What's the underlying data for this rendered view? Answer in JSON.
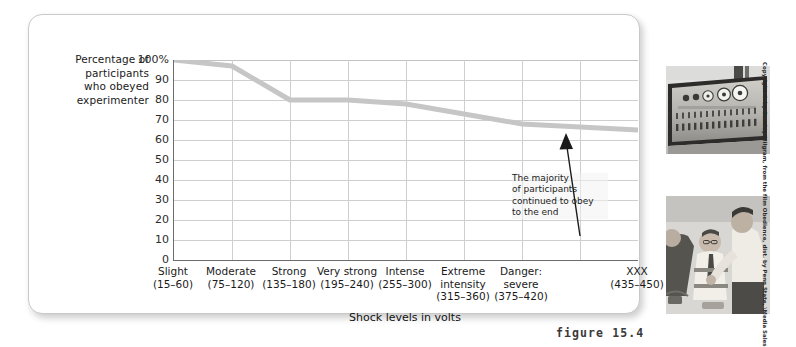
{
  "figure": {
    "number_label": "figure 15.4",
    "card_background": "#ffffff",
    "line_color": "#c6c6c6"
  },
  "chart_data": {
    "type": "line",
    "title": "",
    "ylabel": "Percentage of participants who obeyed experimenter",
    "xlabel": "Shock levels in volts",
    "ylim": [
      0,
      100
    ],
    "yticks": [
      "0",
      "10",
      "20",
      "30",
      "40",
      "50",
      "60",
      "70",
      "80",
      "90",
      "100%"
    ],
    "ytick_values": [
      0,
      10,
      20,
      30,
      40,
      50,
      60,
      70,
      80,
      90,
      100
    ],
    "grid": true,
    "legend": "none",
    "categories": [
      "Slight",
      "Moderate",
      "Strong",
      "Very strong",
      "Intense",
      "Extreme intensity",
      "Danger: severe",
      "XXX"
    ],
    "category_ranges": [
      "(15–60)",
      "(75–120)",
      "(135–180)",
      "(195–240)",
      "(255–300)",
      "(315–360)",
      "(375–420)",
      "(435–450)"
    ],
    "values": [
      100,
      97,
      80,
      80,
      78,
      73,
      68,
      65
    ],
    "annotations": [
      {
        "text": "The majority of participants continued to obey to the end",
        "lines": [
          "The majority",
          "of participants",
          "continued to obey",
          "to the end"
        ],
        "arrow": "up"
      }
    ]
  },
  "x_axis": {
    "title": "Shock levels in volts",
    "labels": [
      {
        "name": "Slight",
        "range": "(15–60)"
      },
      {
        "name": "Moderate",
        "range": "(75–120)"
      },
      {
        "name": "Strong",
        "range": "(135–180)"
      },
      {
        "name": "Very strong",
        "range": "(195–240)"
      },
      {
        "name": "Intense",
        "range": "(255–300)"
      },
      {
        "name": "Extreme intensity",
        "range": "(315–360)"
      },
      {
        "name": "Danger: severe",
        "range": "(375–420)"
      },
      {
        "name": "XXX",
        "range": "(435–450)"
      }
    ]
  },
  "y_axis": {
    "title_lines": [
      "Percentage of",
      "participants",
      "who obeyed",
      "experimenter"
    ]
  },
  "photos": [
    {
      "caption_alt": "shock-generator-panel"
    },
    {
      "caption_alt": "experimenter-strapping-learner"
    }
  ],
  "credit": "Copyright © by Stanley Milgram, from the film Obedience, dist. by Penn State, \\Media Sales"
}
